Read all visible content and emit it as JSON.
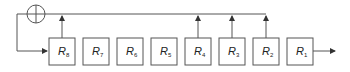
{
  "diagram": {
    "stroke_color": "#555555",
    "registers": [
      {
        "name": "R",
        "sub": "8",
        "x": 49
      },
      {
        "name": "R",
        "sub": "7",
        "x": 83
      },
      {
        "name": "R",
        "sub": "6",
        "x": 117
      },
      {
        "name": "R",
        "sub": "5",
        "x": 151
      },
      {
        "name": "R",
        "sub": "4",
        "x": 185
      },
      {
        "name": "R",
        "sub": "3",
        "x": 219
      },
      {
        "name": "R",
        "sub": "2",
        "x": 253
      },
      {
        "name": "R",
        "sub": "1",
        "x": 287
      }
    ],
    "taps": [
      "R8",
      "R4",
      "R3",
      "R2"
    ],
    "xor_symbol": "⊕",
    "output_arrow": true
  }
}
